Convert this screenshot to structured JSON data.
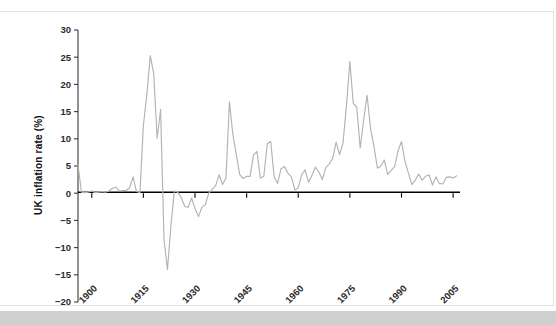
{
  "chart_data": {
    "type": "line",
    "title": "",
    "subtitle": "",
    "xlabel": "",
    "ylabel": "UK inflation rate (%)",
    "xlim": [
      1896,
      2007
    ],
    "ylim": [
      -20,
      30
    ],
    "grid": false,
    "legend": null,
    "legend_position": "none",
    "line_color": "#b3b3b3",
    "zero_line_color": "#000000",
    "axis_color": "#3a3a3a",
    "background_color": "#ffffff",
    "ytick_labels": [
      "30",
      "25",
      "20",
      "15",
      "10",
      "5",
      "0",
      "-5",
      "-10",
      "-15",
      "-20"
    ],
    "ytick_values": [
      30,
      25,
      20,
      15,
      10,
      5,
      0,
      -5,
      -10,
      -15,
      -20
    ],
    "xtick_labels": [
      "1900",
      "1915",
      "1930",
      "1945",
      "1960",
      "1975",
      "1990",
      "2005"
    ],
    "xtick_values": [
      1900,
      1915,
      1930,
      1945,
      1960,
      1975,
      1990,
      2005
    ],
    "xtick_rotation_deg": -45,
    "annotations": [],
    "series": [
      {
        "name": "UK inflation rate",
        "color": "#b3b3b3",
        "x": [
          1896,
          1897,
          1898,
          1899,
          1900,
          1901,
          1902,
          1903,
          1904,
          1905,
          1906,
          1907,
          1908,
          1909,
          1910,
          1911,
          1912,
          1913,
          1914,
          1915,
          1916,
          1917,
          1918,
          1919,
          1920,
          1921,
          1922,
          1923,
          1924,
          1925,
          1926,
          1927,
          1928,
          1929,
          1930,
          1931,
          1932,
          1933,
          1934,
          1935,
          1936,
          1937,
          1938,
          1939,
          1940,
          1941,
          1942,
          1943,
          1944,
          1945,
          1946,
          1947,
          1948,
          1949,
          1950,
          1951,
          1952,
          1953,
          1954,
          1955,
          1956,
          1957,
          1958,
          1959,
          1960,
          1961,
          1962,
          1963,
          1964,
          1965,
          1966,
          1967,
          1968,
          1969,
          1970,
          1971,
          1972,
          1973,
          1974,
          1975,
          1976,
          1977,
          1978,
          1979,
          1980,
          1981,
          1982,
          1983,
          1984,
          1985,
          1986,
          1987,
          1988,
          1989,
          1990,
          1991,
          1992,
          1993,
          1994,
          1995,
          1996,
          1997,
          1998,
          1999,
          2000,
          2001,
          2002,
          2003,
          2004,
          2005,
          2006
        ],
        "y": [
          5.2,
          0.2,
          0.1,
          0.2,
          0.4,
          0.1,
          0.2,
          0.3,
          0.2,
          0.4,
          0.9,
          1.1,
          0.4,
          0.5,
          0.5,
          1.0,
          3.0,
          0.3,
          0.1,
          12.5,
          18.1,
          25.3,
          22.0,
          10.1,
          15.4,
          -8.6,
          -14.0,
          -6.0,
          0.4,
          0.2,
          -0.8,
          -2.4,
          -2.6,
          -0.9,
          -2.8,
          -4.3,
          -2.6,
          -2.1,
          0.0,
          0.7,
          1.4,
          3.4,
          1.6,
          2.8,
          16.8,
          10.8,
          7.1,
          3.4,
          2.7,
          3.1,
          3.1,
          7.0,
          7.7,
          2.8,
          3.1,
          9.1,
          9.5,
          3.0,
          1.8,
          4.5,
          4.9,
          3.7,
          3.0,
          0.6,
          1.0,
          3.4,
          4.3,
          2.0,
          3.3,
          4.8,
          3.9,
          2.5,
          4.7,
          5.4,
          6.4,
          9.4,
          7.1,
          9.2,
          16.0,
          24.2,
          16.5,
          15.8,
          8.3,
          13.4,
          18.0,
          11.9,
          8.6,
          4.6,
          5.0,
          6.1,
          3.4,
          4.2,
          4.9,
          7.8,
          9.5,
          5.9,
          3.7,
          1.6,
          2.4,
          3.5,
          2.4,
          3.1,
          3.4,
          1.5,
          3.0,
          1.8,
          1.7,
          2.9,
          3.0,
          2.8,
          3.2
        ]
      }
    ]
  },
  "watermark": {
    "text": ""
  }
}
